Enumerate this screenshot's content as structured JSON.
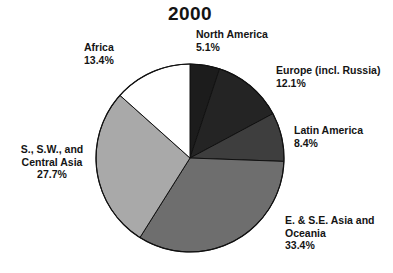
{
  "chart_data": {
    "type": "pie",
    "title": "2000",
    "subtitle": "",
    "xlabel": "",
    "ylabel": "",
    "legend_position": "labels-outside",
    "grid": false,
    "categories": [
      "North America",
      "Europe (incl. Russia)",
      "Latin America",
      "E. & S.E. Asia and Oceania",
      "S., S.W., and Central Asia",
      "Africa"
    ],
    "values": [
      5.1,
      12.1,
      8.4,
      33.4,
      27.7,
      13.4
    ],
    "value_unit": "%",
    "start_angle_deg": 0,
    "direction": "clockwise",
    "slices": [
      {
        "name": "North America",
        "label_line1": "North America",
        "label_line2": "",
        "percent_text": "5.1%",
        "value": 5.1,
        "color": "#1c1c1c",
        "stroke": "#111111"
      },
      {
        "name": "Europe (incl. Russia)",
        "label_line1": "Europe (incl. Russia)",
        "label_line2": "",
        "percent_text": "12.1%",
        "value": 12.1,
        "color": "#242424",
        "stroke": "#111111"
      },
      {
        "name": "Latin America",
        "label_line1": "Latin America",
        "label_line2": "",
        "percent_text": "8.4%",
        "value": 8.4,
        "color": "#3e3e3e",
        "stroke": "#111111"
      },
      {
        "name": "E. & S.E. Asia and Oceania",
        "label_line1": "E. & S.E. Asia and",
        "label_line2": "Oceania",
        "percent_text": "33.4%",
        "value": 33.4,
        "color": "#6e6e6e",
        "stroke": "#111111"
      },
      {
        "name": "S., S.W., and Central Asia",
        "label_line1": "S., S.W., and",
        "label_line2": "Central Asia",
        "percent_text": "27.7%",
        "value": 27.7,
        "color": "#a9a9a9",
        "stroke": "#111111"
      },
      {
        "name": "Africa",
        "label_line1": "Africa",
        "label_line2": "",
        "percent_text": "13.4%",
        "value": 13.4,
        "color": "#ffffff",
        "stroke": "#111111"
      }
    ]
  }
}
